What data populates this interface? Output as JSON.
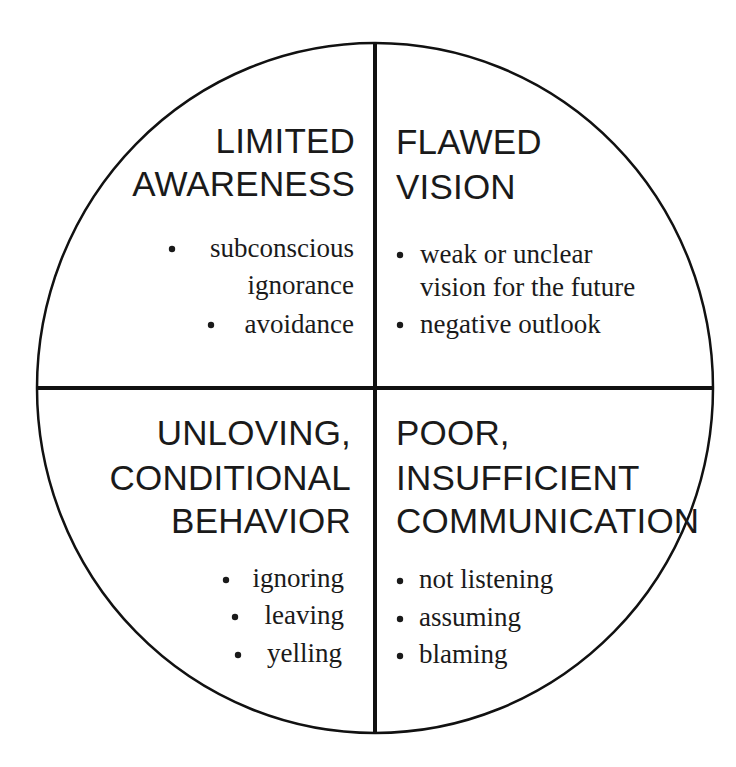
{
  "diagram": {
    "type": "four-quadrant-circle",
    "colors": {
      "line": "#111111",
      "text": "#1a1a1a",
      "background": "#ffffff"
    },
    "quadrants": {
      "top_left": {
        "heading": [
          "LIMITED",
          "AWARENESS"
        ],
        "bullets": [
          {
            "lines": [
              "subconscious",
              "ignorance"
            ]
          },
          {
            "lines": [
              "avoidance"
            ]
          }
        ]
      },
      "top_right": {
        "heading": [
          "FLAWED",
          "VISION"
        ],
        "bullets": [
          {
            "lines": [
              "weak or unclear",
              "vision for the future"
            ]
          },
          {
            "lines": [
              "negative outlook"
            ]
          }
        ]
      },
      "bottom_left": {
        "heading": [
          "UNLOVING,",
          "CONDITIONAL",
          "BEHAVIOR"
        ],
        "bullets": [
          {
            "lines": [
              "ignoring"
            ]
          },
          {
            "lines": [
              "leaving"
            ]
          },
          {
            "lines": [
              "yelling"
            ]
          }
        ]
      },
      "bottom_right": {
        "heading": [
          "POOR,",
          "INSUFFICIENT",
          "COMMUNICATION"
        ],
        "bullets": [
          {
            "lines": [
              "not listening"
            ]
          },
          {
            "lines": [
              "assuming"
            ]
          },
          {
            "lines": [
              "blaming"
            ]
          }
        ]
      }
    }
  }
}
